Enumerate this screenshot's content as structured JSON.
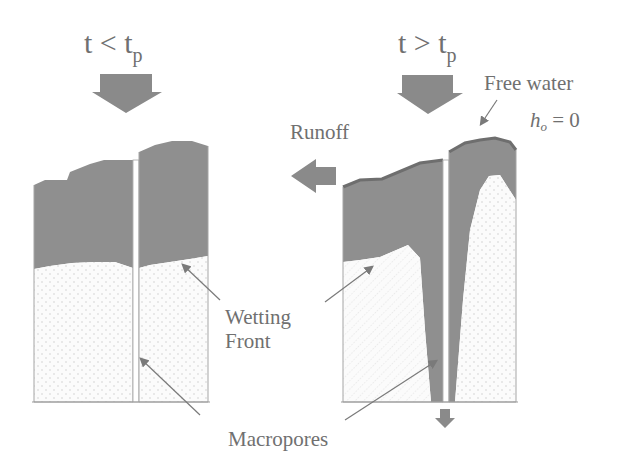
{
  "diagram": {
    "left_panel": {
      "title_main": "t < t",
      "title_sub": "p"
    },
    "right_panel": {
      "title_main": "t > t",
      "title_sub": "p"
    },
    "labels": {
      "runoff": "Runoff",
      "free_water": "Free water",
      "head_var": "h",
      "head_sub": "o",
      "head_eq": " = 0",
      "wetting_line1": "Wetting",
      "wetting_line2": "Front",
      "macropores": "Macropores"
    },
    "colors": {
      "wet_soil": "#8f8f8f",
      "dry_soil": "#fafafa",
      "arrow": "#8a8a8a",
      "outline": "#9a9a9a",
      "text": "#707070",
      "free_water_crust": "#6e6e6e"
    }
  }
}
